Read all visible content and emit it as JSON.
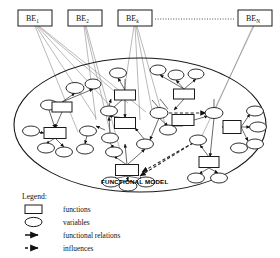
{
  "diagram": {
    "title_label": "FUNCTIONAL MODEL",
    "be_boxes": [
      {
        "name": "be-box-1",
        "base": "BE",
        "sub": "1",
        "x": 18,
        "y": 10,
        "w": 34,
        "h": 16
      },
      {
        "name": "be-box-2",
        "base": "BE",
        "sub": "2",
        "x": 68,
        "y": 10,
        "w": 34,
        "h": 16
      },
      {
        "name": "be-box-k",
        "base": "BE",
        "sub": "k",
        "x": 118,
        "y": 10,
        "w": 34,
        "h": 16
      },
      {
        "name": "be-box-n",
        "base": "BE",
        "sub": "N",
        "x": 238,
        "y": 10,
        "w": 34,
        "h": 16
      }
    ],
    "ellipsis_line": {
      "from_x": 155,
      "to_x": 235,
      "y": 19,
      "style": "dotted"
    },
    "boundary_ellipse": {
      "cx": 140,
      "cy": 125,
      "rx": 126,
      "ry": 67
    },
    "colors": {
      "stroke": "#1a1a1a",
      "link": "#777777",
      "fill": "#ffffff",
      "background": "#ffffff"
    },
    "functions": [
      {
        "name": "function-node-1",
        "cx": 62,
        "cy": 107,
        "w": 20,
        "h": 10
      },
      {
        "name": "function-node-2",
        "cx": 125,
        "cy": 95,
        "w": 21,
        "h": 10
      },
      {
        "name": "function-node-3",
        "cx": 125,
        "cy": 123,
        "w": 21,
        "h": 11
      },
      {
        "name": "function-node-4",
        "cx": 184,
        "cy": 94,
        "w": 21,
        "h": 10
      },
      {
        "name": "function-node-5",
        "cx": 55,
        "cy": 133,
        "w": 22,
        "h": 11
      },
      {
        "name": "function-node-6",
        "cx": 183,
        "cy": 120,
        "w": 22,
        "h": 11
      },
      {
        "name": "function-node-7",
        "cx": 232,
        "cy": 127,
        "w": 18,
        "h": 13
      },
      {
        "name": "function-node-8",
        "cx": 209,
        "cy": 162,
        "w": 20,
        "h": 11
      },
      {
        "name": "function-node-9",
        "cx": 127,
        "cy": 170,
        "w": 23,
        "h": 11
      }
    ],
    "variables": [
      {
        "name": "variable-node-1",
        "cx": 75,
        "cy": 88,
        "rx": 9,
        "ry": 5.5
      },
      {
        "name": "variable-node-2",
        "cx": 93,
        "cy": 84,
        "rx": 8,
        "ry": 5
      },
      {
        "name": "variable-node-3",
        "cx": 118,
        "cy": 73,
        "rx": 8.5,
        "ry": 5
      },
      {
        "name": "variable-node-4",
        "cx": 158,
        "cy": 70,
        "rx": 8,
        "ry": 5
      },
      {
        "name": "variable-node-5",
        "cx": 176,
        "cy": 75,
        "rx": 8,
        "ry": 5
      },
      {
        "name": "variable-node-6",
        "cx": 196,
        "cy": 74,
        "rx": 8,
        "ry": 5
      },
      {
        "name": "variable-node-7",
        "cx": 49,
        "cy": 105,
        "rx": 8.5,
        "ry": 5
      },
      {
        "name": "variable-node-8",
        "cx": 31,
        "cy": 131,
        "rx": 8.5,
        "ry": 5
      },
      {
        "name": "variable-node-9",
        "cx": 109,
        "cy": 111,
        "rx": 8.5,
        "ry": 5
      },
      {
        "name": "variable-node-10",
        "cx": 159,
        "cy": 113,
        "rx": 9,
        "ry": 5.5
      },
      {
        "name": "variable-node-11",
        "cx": 214,
        "cy": 113,
        "rx": 9,
        "ry": 5.5
      },
      {
        "name": "variable-node-12",
        "cx": 88,
        "cy": 131,
        "rx": 8.5,
        "ry": 5
      },
      {
        "name": "variable-node-13",
        "cx": 110,
        "cy": 138,
        "rx": 8.5,
        "ry": 5
      },
      {
        "name": "variable-node-14",
        "cx": 145,
        "cy": 144,
        "rx": 8.5,
        "ry": 5
      },
      {
        "name": "variable-node-15",
        "cx": 198,
        "cy": 140,
        "rx": 8.5,
        "ry": 5
      },
      {
        "name": "variable-node-16",
        "cx": 46,
        "cy": 148,
        "rx": 8.5,
        "ry": 5
      },
      {
        "name": "variable-node-17",
        "cx": 64,
        "cy": 152,
        "rx": 8.5,
        "ry": 5
      },
      {
        "name": "variable-node-18",
        "cx": 85,
        "cy": 149,
        "rx": 8.5,
        "ry": 5
      },
      {
        "name": "variable-node-19",
        "cx": 114,
        "cy": 152,
        "rx": 8.5,
        "ry": 5
      },
      {
        "name": "variable-node-20",
        "cx": 255,
        "cy": 111,
        "rx": 8.5,
        "ry": 5
      },
      {
        "name": "variable-node-21",
        "cx": 258,
        "cy": 127,
        "rx": 8.5,
        "ry": 5
      },
      {
        "name": "variable-node-22",
        "cx": 255,
        "cy": 144,
        "rx": 8.5,
        "ry": 5
      },
      {
        "name": "variable-node-23",
        "cx": 239,
        "cy": 148,
        "rx": 8.5,
        "ry": 5
      },
      {
        "name": "variable-node-24",
        "cx": 111,
        "cy": 182,
        "rx": 9,
        "ry": 5
      },
      {
        "name": "variable-node-25",
        "cx": 146,
        "cy": 182,
        "rx": 9,
        "ry": 5
      },
      {
        "name": "variable-node-26",
        "cx": 128,
        "cy": 186,
        "rx": 9,
        "ry": 5
      },
      {
        "name": "variable-node-27",
        "cx": 196,
        "cy": 178,
        "rx": 8.5,
        "ry": 5
      },
      {
        "name": "variable-node-28",
        "cx": 219,
        "cy": 178,
        "rx": 8.5,
        "ry": 5
      },
      {
        "name": "variable-node-29",
        "cx": 168,
        "cy": 130,
        "rx": 8.5,
        "ry": 5
      }
    ]
  },
  "legend": {
    "title": "Legend:",
    "items": [
      {
        "name": "legend-functions",
        "symbol": "rectangle",
        "label": "functions"
      },
      {
        "name": "legend-variables",
        "symbol": "ellipse",
        "label": "variables"
      },
      {
        "name": "legend-functional-relations",
        "symbol": "solid-arrow",
        "label": "functional relations"
      },
      {
        "name": "legend-influences",
        "symbol": "dashed-arrow",
        "label": "influences"
      }
    ]
  }
}
